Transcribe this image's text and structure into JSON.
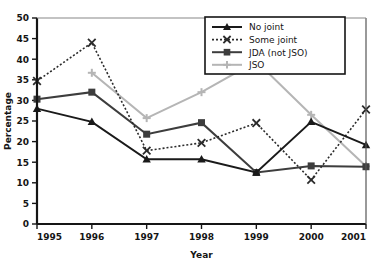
{
  "chart_data": {
    "type": "line",
    "title": "",
    "xlabel": "Year",
    "ylabel": "Percentage",
    "x": [
      1995,
      1996,
      1997,
      1998,
      1999,
      2000,
      2001
    ],
    "xtick_labels": [
      "1995",
      "1996",
      "1997",
      "1998",
      "1999",
      "2000",
      "2001"
    ],
    "ytick_labels": [
      "0",
      "5",
      "10",
      "15",
      "20",
      "25",
      "30",
      "35",
      "40",
      "45",
      "50"
    ],
    "ylim": [
      0,
      50
    ],
    "xlim": [
      1995,
      2001
    ],
    "ytick_step": 5,
    "grid": false,
    "legend_position": "top-right",
    "series": [
      {
        "name": "No joint",
        "color": "#1a1a1a",
        "marker": "triangle",
        "linestyle": "solid",
        "values": [
          28.0,
          24.8,
          15.7,
          15.7,
          12.5,
          24.8,
          19.2
        ]
      },
      {
        "name": "Some joint",
        "color": "#2b2b2b",
        "marker": "x",
        "linestyle": "dotted",
        "values": [
          34.7,
          44.0,
          17.8,
          19.7,
          24.5,
          10.7,
          27.8
        ]
      },
      {
        "name": "JDA (not JSO)",
        "color": "#3d3d3d",
        "marker": "square",
        "linestyle": "solid",
        "values": [
          30.3,
          32.0,
          21.8,
          24.6,
          12.5,
          14.1,
          13.9
        ]
      },
      {
        "name": "JSO",
        "color": "#b5b5b5",
        "marker": "plus",
        "linestyle": "solid",
        "values": [
          null,
          36.7,
          25.7,
          32.0,
          39.5,
          26.5,
          14.0
        ]
      }
    ]
  },
  "legend": {
    "entries": [
      {
        "label": "No joint"
      },
      {
        "label": "Some joint"
      },
      {
        "label": "JDA (not JSO)"
      },
      {
        "label": "JSO"
      }
    ]
  }
}
